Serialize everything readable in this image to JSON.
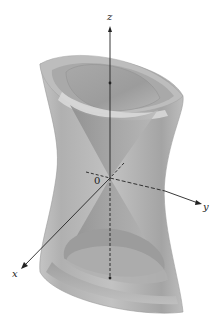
{
  "figure": {
    "labels": {
      "z_axis": "z",
      "y_axis": "y",
      "x_axis": "x",
      "origin": "0"
    },
    "colors": {
      "surface_outer": "#b4b4b4",
      "surface_dark": "#8e8e8e",
      "surface_light": "#d6d6d6",
      "cone": "#9a9a9a",
      "cone_light": "#c8c8c8",
      "axis": "#222222",
      "background": "#ffffff"
    },
    "geometry": {
      "origin": [
        110,
        178
      ],
      "z_arrow_tip": [
        110,
        27
      ],
      "y_arrow_tip": [
        201,
        204
      ],
      "x_arrow_tip": [
        22,
        268
      ]
    }
  }
}
